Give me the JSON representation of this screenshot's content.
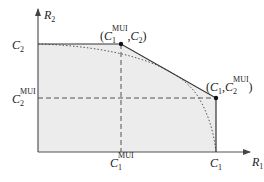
{
  "diagram": {
    "colors": {
      "region_fill": "#ececec",
      "line": "#333333",
      "axis": "#555555"
    },
    "axes": {
      "x_label": {
        "main": "R",
        "sub": "1"
      },
      "y_label": {
        "main": "R",
        "sub": "2"
      }
    },
    "ticks": {
      "c2": {
        "main": "C",
        "sub": "2",
        "sup": ""
      },
      "c2_mui": {
        "main": "C",
        "sub": "2",
        "sup": "MUI"
      },
      "c1_mui": {
        "main": "C",
        "sub": "1",
        "sup": "MUI"
      },
      "c1": {
        "main": "C",
        "sub": "1",
        "sup": ""
      }
    },
    "points": {
      "corner_top": {
        "open": "(",
        "a_main": "C",
        "a_sub": "1",
        "a_sup": "MUI",
        "sep": ",",
        "b_main": "C",
        "b_sub": "2",
        "close": ")"
      },
      "corner_right": {
        "open": "(",
        "a_main": "C",
        "a_sub": "1",
        "sep": ",",
        "b_main": "C",
        "b_sub": "2",
        "b_sup": "MUI",
        "close": ")"
      }
    }
  }
}
